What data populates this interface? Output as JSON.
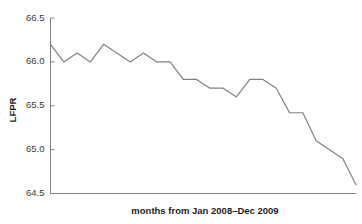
{
  "chart_data": {
    "type": "line",
    "title": "",
    "xlabel": "months from Jan 2008–Dec 2009",
    "ylabel": "LFPR",
    "ylim": [
      64.5,
      66.5
    ],
    "yticks": [
      64.5,
      65.0,
      65.5,
      66.0,
      66.5
    ],
    "ytick_labels": [
      "64.5",
      "65.0",
      "65.5",
      "66.0",
      "66.5"
    ],
    "xticks": [],
    "xtick_labels": [],
    "grid": false,
    "legend": false,
    "line_color": "#808080",
    "axis_color": "#808080",
    "x": [
      1,
      2,
      3,
      4,
      5,
      6,
      7,
      8,
      9,
      10,
      11,
      12,
      13,
      14,
      15,
      16,
      17,
      18,
      19,
      20,
      21,
      22,
      23,
      24
    ],
    "categories": [
      "Jan 2008",
      "Feb 2008",
      "Mar 2008",
      "Apr 2008",
      "May 2008",
      "Jun 2008",
      "Jul 2008",
      "Aug 2008",
      "Sep 2008",
      "Oct 2008",
      "Nov 2008",
      "Dec 2008",
      "Jan 2009",
      "Feb 2009",
      "Mar 2009",
      "Apr 2009",
      "May 2009",
      "Jun 2009",
      "Jul 2009",
      "Aug 2009",
      "Sep 2009",
      "Oct 2009",
      "Nov 2009",
      "Dec 2009"
    ],
    "values": [
      66.2,
      66.0,
      66.1,
      66.0,
      66.2,
      66.1,
      66.0,
      66.1,
      66.0,
      66.0,
      65.8,
      65.8,
      65.7,
      65.7,
      65.6,
      65.8,
      65.8,
      65.7,
      65.42,
      65.42,
      65.1,
      65.0,
      64.9,
      64.6
    ],
    "series": [
      {
        "name": "LFPR",
        "values": [
          66.2,
          66.0,
          66.1,
          66.0,
          66.2,
          66.1,
          66.0,
          66.1,
          66.0,
          66.0,
          65.8,
          65.8,
          65.7,
          65.7,
          65.6,
          65.8,
          65.8,
          65.7,
          65.42,
          65.42,
          65.1,
          65.0,
          64.9,
          64.6
        ]
      }
    ]
  }
}
